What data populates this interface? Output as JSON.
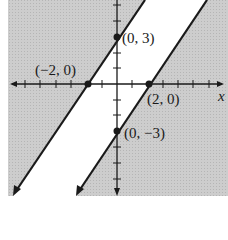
{
  "figure": {
    "colors": {
      "shade": "#c9c9c9",
      "background": "#ffffff",
      "line": "#1a1a1a"
    },
    "axes": {
      "x_label": "x",
      "origin_px": [
        117,
        84
      ],
      "unit_px_x": 15.3,
      "unit_px_y": 15.7
    },
    "lines": [
      {
        "name": "left-boundary-line",
        "through": [
          [
            -2,
            0
          ],
          [
            0,
            3
          ]
        ]
      },
      {
        "name": "right-boundary-line",
        "through": [
          [
            2,
            0
          ],
          [
            0,
            -3
          ]
        ]
      }
    ],
    "points": [
      {
        "name": "point-neg2-0",
        "label": "(−2, 0)",
        "x": -2,
        "y": 0
      },
      {
        "name": "point-0-3",
        "label": "(0, 3)",
        "x": 0,
        "y": 3
      },
      {
        "name": "point-2-0",
        "label": "(2, 0)",
        "x": 2,
        "y": 0
      },
      {
        "name": "point-0-neg3",
        "label": "(0, −3)",
        "x": 0,
        "y": -3
      }
    ]
  }
}
